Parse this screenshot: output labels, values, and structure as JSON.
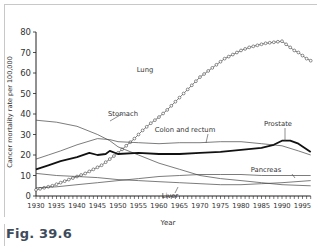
{
  "figure_label": "Fig. 39.6",
  "chart_data": {
    "type": "line",
    "title": "",
    "xlabel": "Year",
    "ylabel": "Cancer mortality rate per 100,000",
    "xlim": [
      1930,
      1997
    ],
    "ylim": [
      0,
      80
    ],
    "xticks": [
      "1930",
      "1935",
      "1940",
      "1945",
      "1950",
      "1955",
      "1960",
      "1965",
      "1970",
      "1975",
      "1980",
      "1985",
      "1990",
      "1995"
    ],
    "yticks": [
      "0",
      "10",
      "20",
      "30",
      "40",
      "50",
      "60",
      "70",
      "80"
    ],
    "grid": false,
    "series": [
      {
        "name": "Lung",
        "label": "Lung",
        "style": "marker",
        "x": [
          1930,
          1932,
          1934,
          1936,
          1938,
          1940,
          1942,
          1944,
          1946,
          1948,
          1950,
          1952,
          1954,
          1956,
          1958,
          1960,
          1962,
          1964,
          1966,
          1968,
          1970,
          1972,
          1974,
          1976,
          1978,
          1980,
          1982,
          1984,
          1986,
          1988,
          1990,
          1991,
          1992,
          1993,
          1994,
          1995,
          1996,
          1997
        ],
        "values": [
          3,
          4,
          5,
          6.5,
          8,
          9.5,
          11,
          13,
          15,
          18,
          21,
          24.5,
          28,
          32,
          35.5,
          38.5,
          42,
          46,
          50,
          54,
          58,
          61,
          64,
          67,
          69,
          71,
          72.5,
          73.5,
          74.5,
          75,
          75.5,
          74,
          72.5,
          71,
          70,
          68.5,
          67,
          66
        ]
      },
      {
        "name": "Stomach",
        "label": "Stomach",
        "style": "thin",
        "x": [
          1930,
          1935,
          1940,
          1945,
          1948,
          1950,
          1955,
          1960,
          1965,
          1970,
          1975,
          1980,
          1985,
          1990,
          1997
        ],
        "values": [
          37,
          36,
          34,
          30,
          27,
          24,
          20,
          16,
          13,
          10,
          8.5,
          7.5,
          6.5,
          5.5,
          5
        ]
      },
      {
        "name": "Colon and rectum",
        "label": "Colon and rectum",
        "style": "thin",
        "x": [
          1930,
          1933,
          1936,
          1940,
          1945,
          1948,
          1950,
          1955,
          1960,
          1965,
          1970,
          1975,
          1980,
          1985,
          1990,
          1994,
          1997
        ],
        "values": [
          18,
          20,
          22,
          25,
          28,
          27.5,
          26.5,
          26,
          25.5,
          26,
          26,
          26.5,
          26.5,
          25.5,
          24.5,
          22,
          20
        ]
      },
      {
        "name": "Prostate",
        "label": "Prostate",
        "style": "bold",
        "x": [
          1930,
          1933,
          1936,
          1940,
          1943,
          1945,
          1947,
          1948,
          1950,
          1955,
          1960,
          1965,
          1970,
          1975,
          1980,
          1985,
          1988,
          1990,
          1992,
          1994,
          1997
        ],
        "values": [
          13,
          15,
          17,
          19,
          21,
          20,
          20.5,
          22,
          20.5,
          21,
          20.5,
          20.5,
          21,
          21.5,
          22.5,
          23.5,
          25,
          27,
          27,
          25.5,
          21.5
        ]
      },
      {
        "name": "Pancreas",
        "label": "Pancreas",
        "style": "thin",
        "x": [
          1930,
          1935,
          1940,
          1945,
          1950,
          1955,
          1960,
          1965,
          1970,
          1975,
          1980,
          1985,
          1990,
          1997
        ],
        "values": [
          4,
          4.5,
          5.5,
          6.5,
          7.5,
          8.5,
          9.5,
          10,
          10.5,
          10.5,
          10.5,
          10,
          10,
          10
        ]
      },
      {
        "name": "Liver",
        "label": "Liver",
        "style": "thin",
        "x": [
          1930,
          1935,
          1940,
          1945,
          1950,
          1955,
          1960,
          1965,
          1970,
          1975,
          1980,
          1985,
          1990,
          1997
        ],
        "values": [
          11,
          10,
          9.5,
          9,
          8,
          7.5,
          7,
          6.5,
          6,
          5.5,
          5.5,
          6,
          6.5,
          7.5
        ]
      }
    ],
    "annotations": [
      {
        "text": "Lung",
        "near_series": "Lung"
      },
      {
        "text": "Stomach",
        "near_series": "Stomach"
      },
      {
        "text": "Colon and rectum",
        "near_series": "Colon and rectum"
      },
      {
        "text": "Prostate",
        "near_series": "Prostate"
      },
      {
        "text": "Pancreas",
        "near_series": "Pancreas"
      },
      {
        "text": "Liver",
        "near_series": "Liver"
      }
    ]
  }
}
